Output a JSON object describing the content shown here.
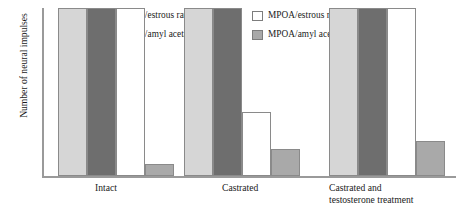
{
  "chart_data": {
    "type": "bar",
    "title": "",
    "xlabel": "",
    "ylabel": "Number of neural impulses",
    "ylim": [
      0,
      100
    ],
    "grid": false,
    "legend_position": "top",
    "categories": [
      "Intact",
      "Castrated",
      "Castrated and\ntestosterone treatment"
    ],
    "series": [
      {
        "name": "Olfactory bulbs/estrous rat urine",
        "color": "#d6d6d6",
        "values": [
          100,
          100,
          100
        ]
      },
      {
        "name": "Olfactory bulbs/amyl acetate",
        "color": "#6e6e6e",
        "values": [
          100,
          100,
          100
        ]
      },
      {
        "name": "MPOA/estrous rat urine",
        "color": "#ffffff",
        "values": [
          100,
          38,
          100
        ]
      },
      {
        "name": "MPOA/amyl acetate",
        "color": "#a9a9a9",
        "values": [
          7,
          16,
          21
        ]
      }
    ]
  },
  "legend": {
    "entries": [
      {
        "label": "Olfactory bulbs/estrous rat urine",
        "color": "#d6d6d6"
      },
      {
        "label": "MPOA/estrous rat urine",
        "color": "#ffffff"
      },
      {
        "label": "Olfactory bulbs/amyl acetate",
        "color": "#6e6e6e"
      },
      {
        "label": "MPOA/amyl acetate",
        "color": "#a9a9a9"
      }
    ]
  },
  "axes": {
    "y_title": "Number of neural impulses",
    "categories": [
      "Intact",
      "Castrated",
      "Castrated and\ntestosterone treatment"
    ]
  }
}
